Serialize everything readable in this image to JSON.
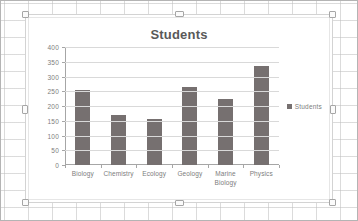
{
  "app": {
    "surface": "spreadsheet-canvas"
  },
  "chart_object": {
    "selected": true,
    "handles": [
      "top-left",
      "top-center",
      "top-right",
      "middle-left",
      "middle-right",
      "bottom-left",
      "bottom-center",
      "bottom-right"
    ]
  },
  "chart_data": {
    "type": "bar",
    "title": "Students",
    "xlabel": "",
    "ylabel": "",
    "categories": [
      "Biology",
      "Chemistry",
      "Ecology",
      "Geology",
      "Marine Biology",
      "Physics"
    ],
    "values": [
      255,
      170,
      156,
      266,
      224,
      337
    ],
    "series": [
      {
        "name": "Students",
        "values": [
          255,
          170,
          156,
          266,
          224,
          337
        ]
      }
    ],
    "ylim": [
      0,
      400
    ],
    "ytick_labels": [
      "400",
      "350",
      "300",
      "250",
      "200",
      "150",
      "100",
      "50",
      "0"
    ],
    "ytick_values": [
      400,
      350,
      300,
      250,
      200,
      150,
      100,
      50,
      0
    ],
    "grid": true,
    "legend": {
      "position": "right",
      "entries": [
        "Students"
      ]
    },
    "colors": {
      "bar": "#767070",
      "title_text": "#595959",
      "axis_text": "#7d7d7d",
      "gridline": "#d9d9d9",
      "axis_line": "#a6a6a6",
      "plot_background": "#ffffff"
    }
  }
}
